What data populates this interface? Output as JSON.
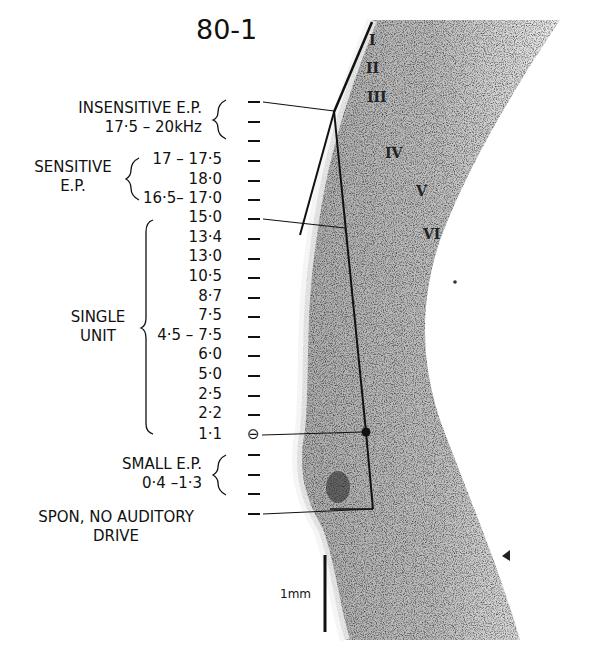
{
  "figure": {
    "title": "80-1",
    "scale_bar_label": "1mm"
  },
  "groups": {
    "insensitive": {
      "line1": "INSENSITIVE  E.P.",
      "line2": "17·5 – 20kHz"
    },
    "sensitive": {
      "line1": "SENSITIVE",
      "line2": "E.P."
    },
    "single_unit": {
      "line1": "SINGLE",
      "line2": "UNIT"
    },
    "small": {
      "line1": "SMALL  E.P.",
      "line2": "0·4 –1·3"
    },
    "spon": {
      "line1": "SPON,  NO  AUDITORY",
      "line2": "DRIVE"
    }
  },
  "values": {
    "sensitive": [
      "17 – 17·5",
      "18·0",
      "16·5– 17·0"
    ],
    "single_unit": [
      "15·0",
      "13·4",
      "13·0",
      "10·5",
      "8·7",
      "7·5",
      "4·5 – 7·5",
      "6·0",
      "5·0",
      "2·5",
      "2·2",
      "1·1"
    ]
  },
  "cortical_layers": [
    "I",
    "II",
    "III",
    "IV",
    "V",
    "VI"
  ],
  "markers": {
    "lesion_symbol": "⊖"
  },
  "colors": {
    "ink": "#111111",
    "tissue_dark": "#5a5a5a",
    "tissue_light": "#c8c8c8",
    "background": "#ffffff"
  }
}
